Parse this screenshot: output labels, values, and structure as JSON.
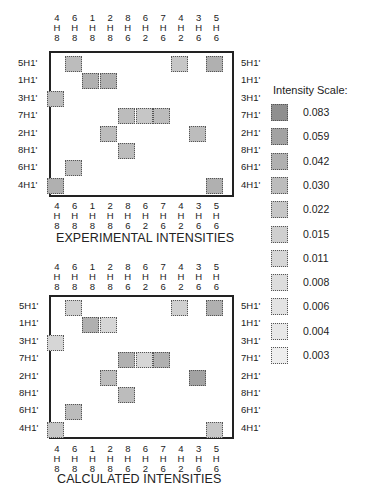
{
  "chart_data": [
    {
      "type": "heatmap",
      "title": "EXPERIMENTAL INTENSITIES",
      "columns": [
        "4H8",
        "6H8",
        "1H8",
        "2H8",
        "8H6",
        "6H2",
        "7H6",
        "4H2",
        "3H6",
        "5H6"
      ],
      "rows": [
        "5H1'",
        "1H1'",
        "3H1'",
        "7H1'",
        "2H1'",
        "8H1'",
        "6H1'",
        "4H1'"
      ],
      "cells": [
        {
          "row": "5H1'",
          "col": "6H8",
          "value": 0.03
        },
        {
          "row": "5H1'",
          "col": "4H2",
          "value": 0.022
        },
        {
          "row": "5H1'",
          "col": "5H6",
          "value": 0.042
        },
        {
          "row": "1H1'",
          "col": "1H8",
          "value": 0.042
        },
        {
          "row": "1H1'",
          "col": "2H8",
          "value": 0.042
        },
        {
          "row": "3H1'",
          "col": "4H8",
          "value": 0.03
        },
        {
          "row": "7H1'",
          "col": "8H6",
          "value": 0.03
        },
        {
          "row": "7H1'",
          "col": "6H2",
          "value": 0.022
        },
        {
          "row": "7H1'",
          "col": "7H6",
          "value": 0.03
        },
        {
          "row": "2H1'",
          "col": "2H8",
          "value": 0.03
        },
        {
          "row": "2H1'",
          "col": "3H6",
          "value": 0.03
        },
        {
          "row": "8H1'",
          "col": "8H6",
          "value": 0.03
        },
        {
          "row": "6H1'",
          "col": "6H8",
          "value": 0.03
        },
        {
          "row": "4H1'",
          "col": "4H8",
          "value": 0.042
        },
        {
          "row": "4H1'",
          "col": "5H6",
          "value": 0.042
        }
      ]
    },
    {
      "type": "heatmap",
      "title": "CALCULATED INTENSITIES",
      "columns": [
        "4H8",
        "6H8",
        "1H8",
        "2H8",
        "8H6",
        "6H2",
        "7H6",
        "4H2",
        "3H6",
        "5H6"
      ],
      "rows": [
        "5H1'",
        "1H1'",
        "3H1'",
        "7H1'",
        "2H1'",
        "8H1'",
        "6H1'",
        "4H1'"
      ],
      "cells": [
        {
          "row": "5H1'",
          "col": "6H8",
          "value": 0.015
        },
        {
          "row": "5H1'",
          "col": "4H2",
          "value": 0.015
        },
        {
          "row": "5H1'",
          "col": "5H6",
          "value": 0.042
        },
        {
          "row": "1H1'",
          "col": "1H8",
          "value": 0.042
        },
        {
          "row": "1H1'",
          "col": "2H8",
          "value": 0.011
        },
        {
          "row": "3H1'",
          "col": "4H8",
          "value": 0.011
        },
        {
          "row": "7H1'",
          "col": "8H6",
          "value": 0.042
        },
        {
          "row": "7H1'",
          "col": "6H2",
          "value": 0.011
        },
        {
          "row": "7H1'",
          "col": "7H6",
          "value": 0.042
        },
        {
          "row": "2H1'",
          "col": "2H8",
          "value": 0.03
        },
        {
          "row": "2H1'",
          "col": "3H6",
          "value": 0.059
        },
        {
          "row": "8H1'",
          "col": "8H6",
          "value": 0.03
        },
        {
          "row": "6H1'",
          "col": "6H8",
          "value": 0.03
        },
        {
          "row": "4H1'",
          "col": "4H8",
          "value": 0.022
        },
        {
          "row": "4H1'",
          "col": "5H6",
          "value": 0.022
        }
      ]
    }
  ],
  "columns": [
    {
      "num": "4",
      "h": "H",
      "sub": "8"
    },
    {
      "num": "6",
      "h": "H",
      "sub": "8"
    },
    {
      "num": "1",
      "h": "H",
      "sub": "8"
    },
    {
      "num": "2",
      "h": "H",
      "sub": "8"
    },
    {
      "num": "8",
      "h": "H",
      "sub": "6"
    },
    {
      "num": "6",
      "h": "H",
      "sub": "2"
    },
    {
      "num": "7",
      "h": "H",
      "sub": "6"
    },
    {
      "num": "4",
      "h": "H",
      "sub": "2"
    },
    {
      "num": "3",
      "h": "H",
      "sub": "6"
    },
    {
      "num": "5",
      "h": "H",
      "sub": "6"
    }
  ],
  "rows": [
    "5H1'",
    "1H1'",
    "3H1'",
    "7H1'",
    "2H1'",
    "8H1'",
    "6H1'",
    "4H1'"
  ],
  "experimental": {
    "title": "EXPERIMENTAL INTENSITIES",
    "cells": [
      [
        0,
        1,
        "0.030"
      ],
      [
        0,
        7,
        "0.022"
      ],
      [
        0,
        9,
        "0.042"
      ],
      [
        1,
        2,
        "0.042"
      ],
      [
        1,
        3,
        "0.042"
      ],
      [
        2,
        0,
        "0.030"
      ],
      [
        3,
        4,
        "0.030"
      ],
      [
        3,
        5,
        "0.022"
      ],
      [
        3,
        6,
        "0.030"
      ],
      [
        4,
        3,
        "0.030"
      ],
      [
        4,
        8,
        "0.030"
      ],
      [
        5,
        4,
        "0.030"
      ],
      [
        6,
        1,
        "0.030"
      ],
      [
        7,
        0,
        "0.042"
      ],
      [
        7,
        9,
        "0.042"
      ]
    ]
  },
  "calculated": {
    "title": "CALCULATED INTENSITIES",
    "cells": [
      [
        0,
        1,
        "0.015"
      ],
      [
        0,
        7,
        "0.015"
      ],
      [
        0,
        9,
        "0.042"
      ],
      [
        1,
        2,
        "0.042"
      ],
      [
        1,
        3,
        "0.011"
      ],
      [
        2,
        0,
        "0.011"
      ],
      [
        3,
        4,
        "0.042"
      ],
      [
        3,
        5,
        "0.011"
      ],
      [
        3,
        6,
        "0.042"
      ],
      [
        4,
        3,
        "0.030"
      ],
      [
        4,
        8,
        "0.059"
      ],
      [
        5,
        4,
        "0.030"
      ],
      [
        6,
        1,
        "0.030"
      ],
      [
        7,
        0,
        "0.022"
      ],
      [
        7,
        9,
        "0.022"
      ]
    ]
  },
  "legend": {
    "title": "Intensity Scale:",
    "items": [
      {
        "value": "0.083",
        "color": "#8f8f8f"
      },
      {
        "value": "0.059",
        "color": "#a2a2a2"
      },
      {
        "value": "0.042",
        "color": "#b0b0b0"
      },
      {
        "value": "0.030",
        "color": "#bcbcbc"
      },
      {
        "value": "0.022",
        "color": "#c6c6c6"
      },
      {
        "value": "0.015",
        "color": "#cfcfcf"
      },
      {
        "value": "0.011",
        "color": "#d6d6d6"
      },
      {
        "value": "0.008",
        "color": "#dddddd"
      },
      {
        "value": "0.006",
        "color": "#e3e3e3"
      },
      {
        "value": "0.004",
        "color": "#e8e8e8"
      },
      {
        "value": "0.003",
        "color": "#eeeeee"
      }
    ]
  }
}
